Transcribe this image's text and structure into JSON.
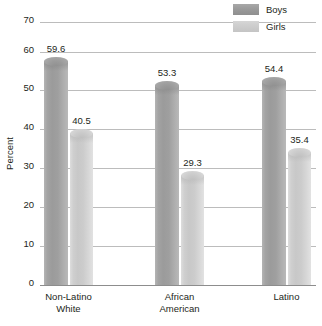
{
  "chart_data": {
    "type": "bar",
    "title": "",
    "subtitle": "",
    "xlabel": "",
    "ylabel": "Percent",
    "ylim": [
      0,
      70
    ],
    "ytick_values": [
      0,
      10,
      20,
      30,
      40,
      50,
      60,
      70
    ],
    "ytick_labels": [
      "0",
      "10",
      "20",
      "30",
      "40",
      "50",
      "60",
      "70"
    ],
    "grid": true,
    "legend_position": "top-right",
    "categories": [
      "Non-Latino White",
      "African American",
      "Latino"
    ],
    "category_label_lines": [
      [
        "Non-Latino",
        "White"
      ],
      [
        "African",
        "American"
      ],
      [
        "Latino"
      ]
    ],
    "series": [
      {
        "name": "Boys",
        "color": "#9b9b9b",
        "values": [
          59.6,
          53.3,
          54.4
        ],
        "value_labels": [
          "59.6",
          "53.3",
          "54.4"
        ]
      },
      {
        "name": "Girls",
        "color": "#c8c8c8",
        "values": [
          40.5,
          29.3,
          35.4
        ],
        "value_labels": [
          "40.5",
          "29.3",
          "35.4"
        ]
      }
    ]
  },
  "legend": {
    "items": [
      {
        "label": "Boys",
        "swatch": "boys-swatch"
      },
      {
        "label": "Girls",
        "swatch": "girls-swatch"
      }
    ]
  },
  "axis": {
    "y_title": "Percent"
  }
}
